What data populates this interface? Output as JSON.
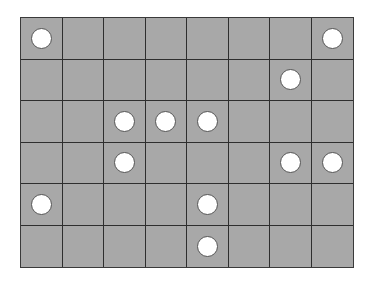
{
  "board": {
    "rows": 6,
    "cols": 8,
    "cell_color": "#a8a8a8",
    "line_color": "#2e2e2e",
    "piece_color": "#ffffff",
    "pieces": [
      {
        "row": 0,
        "col": 0
      },
      {
        "row": 0,
        "col": 7
      },
      {
        "row": 1,
        "col": 6
      },
      {
        "row": 2,
        "col": 2
      },
      {
        "row": 2,
        "col": 3
      },
      {
        "row": 2,
        "col": 4
      },
      {
        "row": 3,
        "col": 2
      },
      {
        "row": 3,
        "col": 6
      },
      {
        "row": 3,
        "col": 7
      },
      {
        "row": 4,
        "col": 0
      },
      {
        "row": 4,
        "col": 4
      },
      {
        "row": 5,
        "col": 4
      }
    ]
  }
}
